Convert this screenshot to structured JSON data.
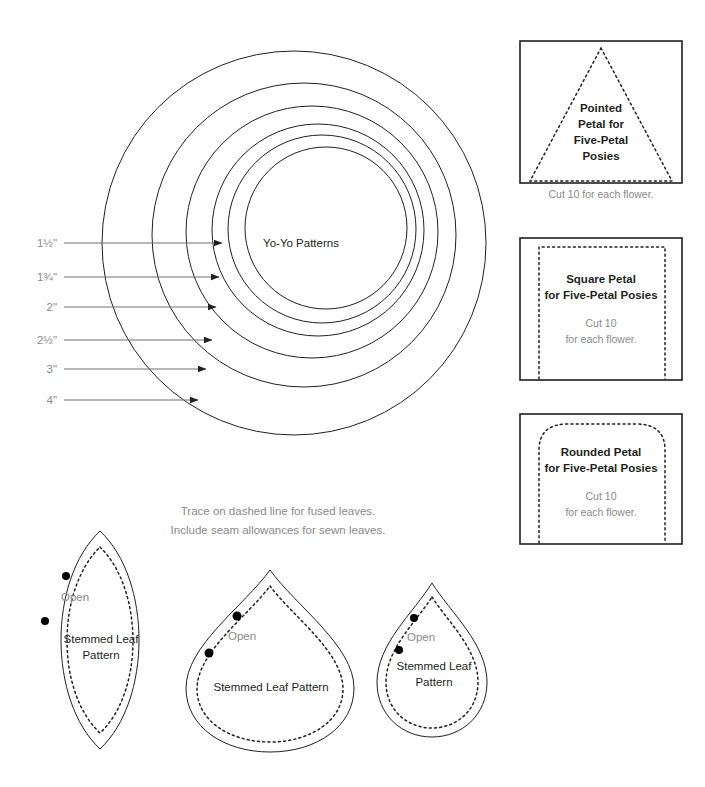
{
  "page": {
    "title": "Yo-Yo Patterns",
    "background": "#ffffff",
    "ink": "#231f20",
    "gray": "#8a8a8a",
    "leader_color": "#6f6f6f"
  },
  "yoyo": {
    "center_label": "Yo-Yo Patterns",
    "size_labels": [
      {
        "text": "1½\"",
        "y": 243
      },
      {
        "text": "1¾\"",
        "y": 277
      },
      {
        "text": "2\"",
        "y": 307
      },
      {
        "text": "2½\"",
        "y": 340
      },
      {
        "text": "3\"",
        "y": 369
      },
      {
        "text": "4\"",
        "y": 400
      }
    ],
    "circle_sizes": [
      "1½\"",
      "1¾\"",
      "2\"",
      "2½\"",
      "3\"",
      "4\""
    ]
  },
  "petal_panels": [
    {
      "name": "pointed-petal",
      "shape": "triangle",
      "title_lines": [
        "Pointed",
        "Petal for",
        "Five-Petal",
        "Posies"
      ],
      "caption_lines": [
        "Cut 10 for each flower."
      ],
      "caption_inside": false
    },
    {
      "name": "square-petal",
      "shape": "square",
      "title_lines": [
        "Square Petal",
        "for Five-Petal Posies"
      ],
      "caption_lines": [
        "Cut 10",
        "for each flower."
      ],
      "caption_inside": true
    },
    {
      "name": "rounded-petal",
      "shape": "rounded",
      "title_lines": [
        "Rounded Petal",
        "for Five-Petal Posies"
      ],
      "caption_lines": [
        "Cut 10",
        "for each flower."
      ],
      "caption_inside": true
    }
  ],
  "leaf_note": {
    "line1": "Trace on dashed line for fused leaves.",
    "line2": "Include seam allowances for sewn leaves."
  },
  "leaves": [
    {
      "name": "leaf-lens",
      "open_label": "Open",
      "title_lines": [
        "Stemmed Leaf",
        "Pattern"
      ]
    },
    {
      "name": "leaf-teardrop-large",
      "open_label": "Open",
      "title_lines": [
        "Stemmed Leaf Pattern"
      ]
    },
    {
      "name": "leaf-teardrop-small",
      "open_label": "Open",
      "title_lines": [
        "Stemmed Leaf",
        "Pattern"
      ]
    }
  ]
}
